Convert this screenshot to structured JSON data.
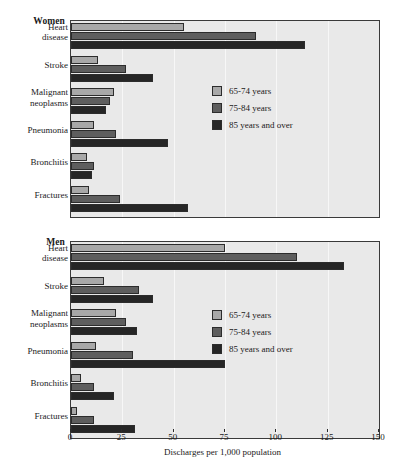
{
  "chart_data": {
    "type": "bar",
    "orientation": "horizontal",
    "title": "",
    "xlabel": "Discharges per 1,000 population",
    "ylabel": "",
    "xlim": [
      0,
      150
    ],
    "xticks": [
      0,
      25,
      50,
      75,
      100,
      125,
      150
    ],
    "grid": true,
    "legend_position": "inside-right",
    "series_names": [
      "65-74 years",
      "75-84 years",
      "85 years and over"
    ],
    "series_colors": [
      "#a8a8a8",
      "#5e5e5e",
      "#262626"
    ],
    "categories": [
      "Heart disease",
      "Stroke",
      "Malignant neoplasms",
      "Pneumonia",
      "Bronchitis",
      "Fractures"
    ],
    "panels": [
      {
        "name": "Women",
        "series": [
          {
            "name": "65-74 years",
            "values": [
              55,
              13,
              21,
              11,
              8,
              9
            ]
          },
          {
            "name": "75-84 years",
            "values": [
              90,
              27,
              19,
              22,
              11,
              24
            ]
          },
          {
            "name": "85 years and over",
            "values": [
              114,
              40,
              17,
              47,
              10,
              57
            ]
          }
        ]
      },
      {
        "name": "Men",
        "series": [
          {
            "name": "65-74 years",
            "values": [
              75,
              16,
              22,
              12,
              5,
              3
            ]
          },
          {
            "name": "75-84 years",
            "values": [
              110,
              33,
              27,
              30,
              11,
              11
            ]
          },
          {
            "name": "85 years and over",
            "values": [
              133,
              40,
              32,
              75,
              21,
              31
            ]
          }
        ]
      }
    ]
  },
  "axis": {
    "title": "Discharges per 1,000 population",
    "tick_labels": [
      "0",
      "25",
      "50",
      "75",
      "100",
      "125",
      "150"
    ]
  },
  "panels": {
    "women": {
      "title": "Women",
      "categories": [
        {
          "label": "Heart\ndisease"
        },
        {
          "label": "Stroke"
        },
        {
          "label": "Malignant\nneoplasms"
        },
        {
          "label": "Pneumonia"
        },
        {
          "label": "Bronchitis"
        },
        {
          "label": "Fractures"
        }
      ],
      "legend": [
        {
          "label": "65-74 years"
        },
        {
          "label": "75-84 years"
        },
        {
          "label": "85 years and over"
        }
      ]
    },
    "men": {
      "title": "Men",
      "categories": [
        {
          "label": "Heart\ndisease"
        },
        {
          "label": "Stroke"
        },
        {
          "label": "Malignant\nneoplasms"
        },
        {
          "label": "Pneumonia"
        },
        {
          "label": "Bronchitis"
        },
        {
          "label": "Fractures"
        }
      ],
      "legend": [
        {
          "label": "65-74 years"
        },
        {
          "label": "75-84 years"
        },
        {
          "label": "85 years and over"
        }
      ]
    }
  }
}
